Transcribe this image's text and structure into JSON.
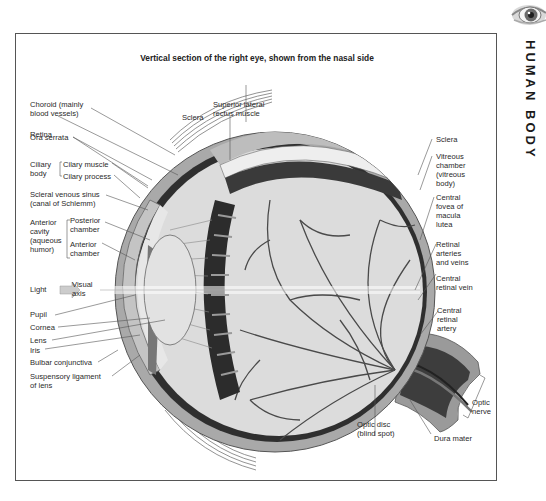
{
  "header": {
    "section_title": "HUMAN BODY",
    "icon": "eye-photo-icon"
  },
  "figure": {
    "title": "Vertical section of the right eye, shown from the nasal side",
    "labels_left": [
      {
        "id": "choroid",
        "text": "Choroid (mainly\nblood vessels)"
      },
      {
        "id": "retina",
        "text": "Retina"
      },
      {
        "id": "ora_serrata",
        "text": "Ora serrata"
      },
      {
        "id": "ciliary_body",
        "text": "Ciliary\nbody"
      },
      {
        "id": "ciliary_muscle",
        "text": "Cilary muscle"
      },
      {
        "id": "ciliary_process",
        "text": "Cilary process"
      },
      {
        "id": "scleral_venous_sinus",
        "text": "Scleral venous sinus\n(canal of Schlemm)"
      },
      {
        "id": "anterior_cavity",
        "text": "Anterior\ncavity\n(aqueous\nhumor)"
      },
      {
        "id": "posterior_chamber",
        "text": "Posterior\nchamber"
      },
      {
        "id": "anterior_chamber",
        "text": "Anterior\nchamber"
      },
      {
        "id": "light",
        "text": "Light"
      },
      {
        "id": "visual_axis",
        "text": "Visual\naxis"
      },
      {
        "id": "pupil",
        "text": "Pupil"
      },
      {
        "id": "cornea",
        "text": "Cornea"
      },
      {
        "id": "lens",
        "text": "Lens"
      },
      {
        "id": "iris",
        "text": "Iris"
      },
      {
        "id": "bulbar_conjunctiva",
        "text": "Bulbar conjunctiva"
      },
      {
        "id": "suspensory_ligament",
        "text": "Suspensory ligament\nof lens"
      }
    ],
    "labels_top": [
      {
        "id": "superior_lateral_rectus",
        "text": "Superior lateral\nrectus muscle"
      },
      {
        "id": "sclera_top",
        "text": "Sclera"
      }
    ],
    "labels_right": [
      {
        "id": "sclera_right",
        "text": "Sclera"
      },
      {
        "id": "vitreous_chamber",
        "text": "Vitreous\nchamber\n(vitreous\nbody)"
      },
      {
        "id": "central_fovea",
        "text": "Central\nfovea of\nmacula\nlutea"
      },
      {
        "id": "retinal_arteries_veins",
        "text": "Retinal\narteries\nand veins"
      },
      {
        "id": "central_retinal_vein",
        "text": "Central\nretinal vein"
      },
      {
        "id": "central_retinal_artery",
        "text": "Central\nretinal\nartery"
      },
      {
        "id": "optic_nerve",
        "text": "Optic\nnerve"
      }
    ],
    "labels_bottom": [
      {
        "id": "optic_disc",
        "text": "Optic disc\n(blind spot)"
      },
      {
        "id": "dura_mater",
        "text": "Dura mater"
      }
    ],
    "colors": {
      "sclera": "#a8a8a8",
      "choroid": "#3a3a3a",
      "retina_bg": "#dedede",
      "vessels": "#4a4a4a",
      "lens": "#e4e4e4",
      "cornea": "#c8c8c8",
      "leader_lines": "#555555"
    }
  }
}
